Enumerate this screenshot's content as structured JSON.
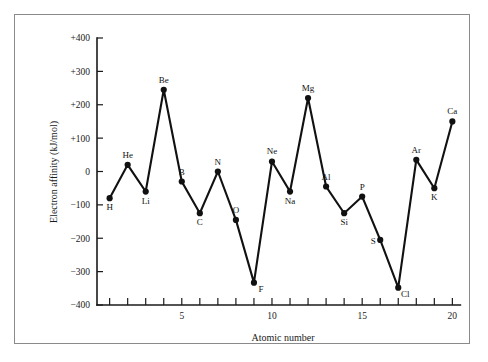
{
  "chart_data": {
    "type": "line",
    "title": "",
    "xlabel": "Atomic number",
    "ylabel": "Electron affinity (kJ/mol)",
    "xlim": [
      0.3,
      20.7
    ],
    "ylim": [
      -400,
      400
    ],
    "grid": false,
    "legend": "none",
    "x_major_ticks": [
      5,
      10,
      15,
      20
    ],
    "x_major_tick_labels": [
      "5",
      "10",
      "15",
      "20"
    ],
    "x_minor_ticks": [
      1,
      2,
      3,
      4,
      6,
      7,
      8,
      9,
      11,
      12,
      13,
      14,
      16,
      17,
      18,
      19
    ],
    "y_ticks": [
      400,
      300,
      200,
      100,
      0,
      -100,
      -200,
      -300,
      -400
    ],
    "y_tick_labels": [
      "+400",
      "+300",
      "+200",
      "+100",
      "0",
      "−100",
      "−200",
      "−300",
      "−400"
    ],
    "x": [
      1,
      2,
      3,
      4,
      5,
      6,
      7,
      8,
      9,
      10,
      11,
      12,
      13,
      14,
      15,
      16,
      17,
      18,
      19,
      20
    ],
    "values": [
      -80,
      20,
      -60,
      245,
      -30,
      -125,
      0,
      -145,
      -333,
      30,
      -60,
      220,
      -45,
      -125,
      -75,
      -205,
      -348,
      35,
      -50,
      150
    ],
    "point_labels": [
      "H",
      "He",
      "Li",
      "Be",
      "B",
      "C",
      "N",
      "O",
      "F",
      "Ne",
      "Na",
      "Mg",
      "Al",
      "Si",
      "P",
      "S",
      "Cl",
      "Ar",
      "K",
      "Ca"
    ],
    "point_label_positions": [
      "below",
      "above",
      "below",
      "above",
      "above",
      "below",
      "above",
      "above",
      "right",
      "above",
      "below",
      "above",
      "above",
      "below",
      "above",
      "left",
      "right",
      "above",
      "below",
      "above"
    ]
  }
}
